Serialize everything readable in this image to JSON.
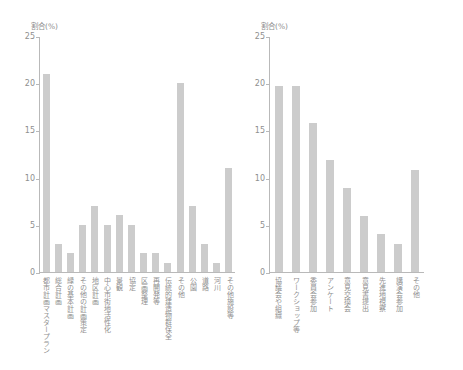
{
  "chart_data": [
    {
      "id": "left",
      "type": "bar",
      "title": "",
      "ylabel": "割合(%)",
      "xlabel": "",
      "ylim": [
        0,
        25
      ],
      "yticks": [
        0,
        5,
        10,
        15,
        20,
        25
      ],
      "ytick_labels": [
        "0",
        "5",
        "10",
        "15",
        "20",
        "25"
      ],
      "grid": false,
      "legend": "none",
      "bar_color": "#cccccc",
      "axis_color": "#b9b9b9",
      "categories": [
        "都市計画マスタープラン",
        "総合計画",
        "緑の基本計画",
        "その他の計画策定",
        "地区計画",
        "中心市街地活性化",
        "景観",
        "協定",
        "区画整理",
        "再開発等",
        "伝統的建造物群保全",
        "その他",
        "公園",
        "道路",
        "河川",
        "その他施設等"
      ],
      "values": [
        21,
        3,
        2,
        5,
        7,
        5,
        6,
        5,
        2,
        2,
        1,
        20,
        7,
        3,
        1,
        11
      ]
    },
    {
      "id": "right",
      "type": "bar",
      "title": "",
      "ylabel": "割合(%)",
      "xlabel": "",
      "ylim": [
        0,
        25
      ],
      "yticks": [
        0,
        5,
        10,
        15,
        20,
        25
      ],
      "ytick_labels": [
        "0",
        "5",
        "10",
        "15",
        "20",
        "25"
      ],
      "grid": false,
      "legend": "none",
      "bar_color": "#cccccc",
      "axis_color": "#b9b9b9",
      "categories": [
        "協議会や組織",
        "ワークショップ等",
        "委員会参加",
        "アンケート",
        "意見交換会",
        "意見書提出",
        "先進地視察",
        "講演会参加",
        "その他"
      ],
      "values": [
        19.7,
        19.7,
        15.8,
        11.9,
        8.9,
        5.9,
        4.0,
        3.0,
        10.8
      ]
    }
  ]
}
